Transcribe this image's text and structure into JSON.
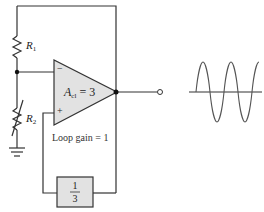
{
  "diagram": {
    "type": "op-amp oscillator with feedback (Barkhausen criterion)",
    "components": {
      "r1": {
        "name": "R",
        "sub": "1"
      },
      "r2": {
        "name": "R",
        "sub": "2",
        "variable": true
      },
      "opamp": {
        "gain_symbol": "A",
        "gain_sub": "cl",
        "gain_value": "= 3",
        "input_minus": "−",
        "input_plus": "+"
      },
      "feedback": {
        "numerator": "1",
        "denominator": "3"
      },
      "ground": "ground-symbol",
      "output_terminal": "open-circle"
    },
    "loop_gain_label": "Loop gain = 1",
    "output_waveform": {
      "shape": "sine",
      "cycles": 3
    },
    "colors": {
      "wire": "#333333",
      "component_fill": "#e2e2e2",
      "waveform": "#555555"
    }
  }
}
